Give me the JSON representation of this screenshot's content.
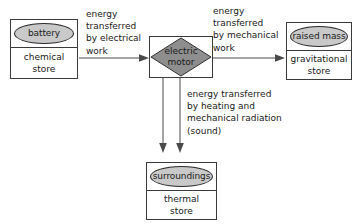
{
  "diagram": {
    "colors": {
      "ellipse_fill": "#c9c9c9",
      "diamond_fill": "#8e8e8e",
      "box_stroke": "#3a3a3a",
      "arrow_stroke": "#4a4a4a",
      "background": "#ffffff",
      "text": "#1a1a1a"
    },
    "nodes": {
      "battery": {
        "label": "battery",
        "store_line1": "chemical",
        "store_line2": "store",
        "shape": "ellipse-in-box"
      },
      "motor": {
        "label_line1": "electric",
        "label_line2": "motor",
        "shape": "diamond-in-box"
      },
      "raised_mass": {
        "label": "raised mass",
        "store_line1": "gravitational",
        "store_line2": "store",
        "shape": "ellipse-in-box"
      },
      "surroundings": {
        "label": "surroundings",
        "store_line1": "thermal",
        "store_line2": "store",
        "shape": "ellipse-in-box"
      }
    },
    "arrows": {
      "electrical": {
        "from": "battery",
        "to": "motor",
        "direction": "right",
        "caption_lines": [
          "energy",
          "transferred",
          "by electrical",
          "work"
        ]
      },
      "mechanical": {
        "from": "motor",
        "to": "raised_mass",
        "direction": "right",
        "caption_lines": [
          "energy",
          "transferred",
          "by mechanical",
          "work"
        ]
      },
      "thermal": {
        "from": "motor",
        "to": "surroundings",
        "direction": "down",
        "count": 2,
        "caption_lines": [
          "energy transferred",
          "by heating and",
          "mechanical radiation",
          "(sound)"
        ]
      }
    }
  }
}
